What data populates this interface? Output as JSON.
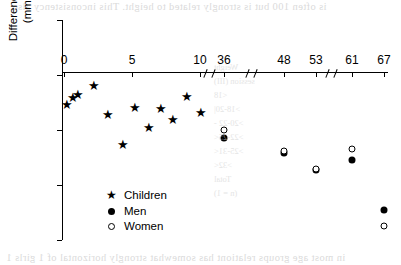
{
  "figure": {
    "y_axis_title_line1": "Difference in systolic blood pressure",
    "y_axis_title_line2": "(mmHg) per kg of birthweight"
  },
  "legend": {
    "items": [
      {
        "marker": "star-marker",
        "label": "Children"
      },
      {
        "marker": "filled-circle-marker",
        "label": "Men"
      },
      {
        "marker": "open-circle-marker",
        "label": "Women"
      }
    ]
  },
  "page_bleed": {
    "top_text": "is often 100  but is strongly related to height. This inconsistency also",
    "bottom_text": "in most age groups relationt has somewhat strongly horizontal of 1 girls 1",
    "table_rows": [
      "Weight",
      "session (III)",
      "<18",
      ">18-20|",
      ">20-22 -",
      ">22-25<",
      ">25-31<",
      ">32<",
      "Total",
      "(n = 1)"
    ]
  },
  "chart_data": {
    "type": "scatter",
    "title": "",
    "xlabel": "",
    "ylabel": "Difference in systolic blood pressure (mmHg) per kg of birthweight",
    "ylim": [
      -6,
      2
    ],
    "yticks": [
      2,
      0,
      -2,
      -4,
      -6
    ],
    "ytick_labels": [
      "2",
      "0",
      "-2",
      "-4",
      "-6"
    ],
    "xticks": [
      0,
      5,
      10,
      36,
      48,
      53,
      61,
      67
    ],
    "xtick_labels": [
      "0",
      "5",
      "10",
      "36",
      "48",
      "53",
      "61",
      "67"
    ],
    "x_axis_position_y": 0,
    "axis_breaks": [
      [
        10,
        36
      ],
      [
        36,
        48
      ],
      [
        53,
        61
      ]
    ],
    "grid": false,
    "legend_position": "lower-left-inside",
    "series": [
      {
        "name": "Children",
        "marker": "star",
        "points": [
          {
            "x": 0.2,
            "y": -1.05
          },
          {
            "x": 0.6,
            "y": -0.8
          },
          {
            "x": 1.0,
            "y": -0.7
          },
          {
            "x": 2.2,
            "y": -0.35
          },
          {
            "x": 3.2,
            "y": -1.4
          },
          {
            "x": 4.3,
            "y": -2.5
          },
          {
            "x": 5.2,
            "y": -1.15
          },
          {
            "x": 6.2,
            "y": -1.9
          },
          {
            "x": 7.1,
            "y": -1.2
          },
          {
            "x": 8.0,
            "y": -1.6
          },
          {
            "x": 9.0,
            "y": -0.75
          },
          {
            "x": 10.2,
            "y": -1.35
          }
        ]
      },
      {
        "name": "Men",
        "marker": "filled-circle",
        "points": [
          {
            "x": 36,
            "y": -2.3
          },
          {
            "x": 48,
            "y": -2.85
          },
          {
            "x": 53,
            "y": -3.45
          },
          {
            "x": 61,
            "y": -3.1
          },
          {
            "x": 67,
            "y": -4.9
          }
        ]
      },
      {
        "name": "Women",
        "marker": "open-circle",
        "points": [
          {
            "x": 36,
            "y": -2.0
          },
          {
            "x": 48,
            "y": -2.75
          },
          {
            "x": 53,
            "y": -3.4
          },
          {
            "x": 61,
            "y": -2.7
          },
          {
            "x": 67,
            "y": -5.5
          }
        ]
      }
    ]
  }
}
